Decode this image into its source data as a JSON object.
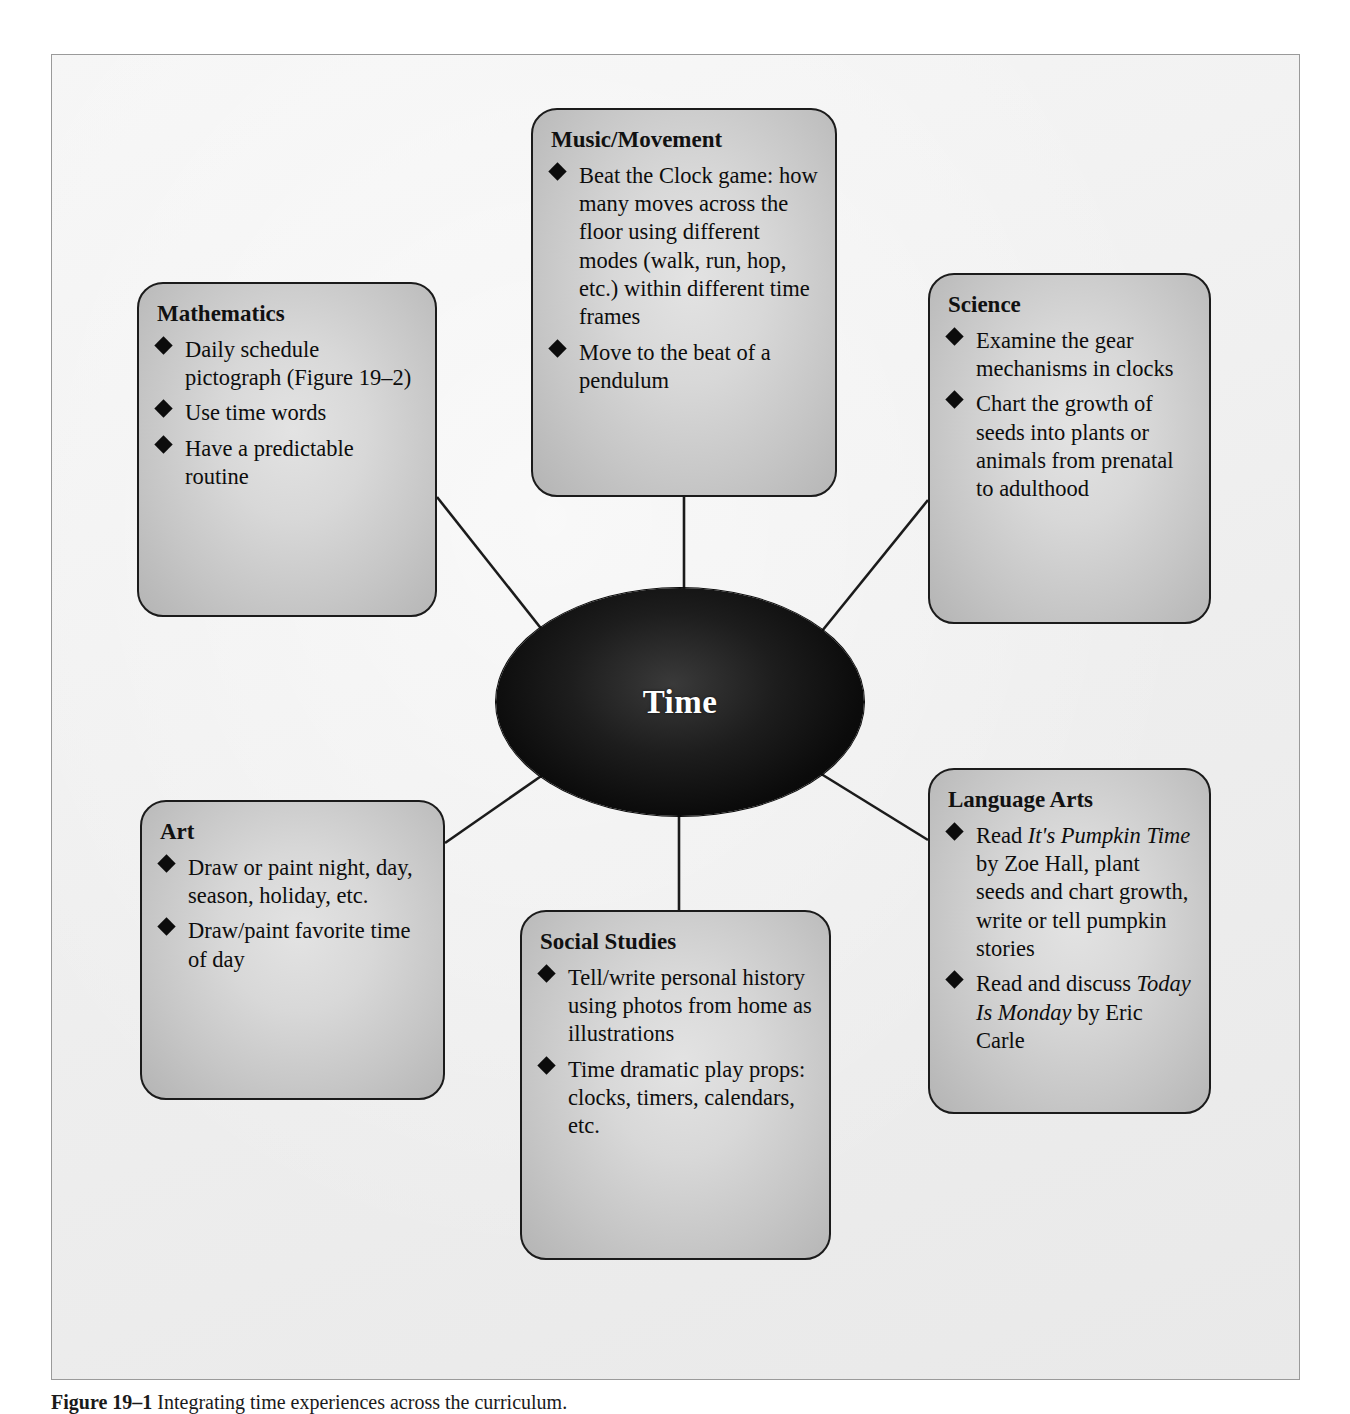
{
  "figure": {
    "center_label": "Time",
    "caption_label": "Figure 19–1",
    "caption_text": "Integrating time experiences across the curriculum."
  },
  "nodes": [
    {
      "id": "mathematics",
      "title": "Mathematics",
      "items": [
        "Daily schedule pictograph (Figure 19–2)",
        "Use time words",
        "Have a predictable routine"
      ]
    },
    {
      "id": "music-movement",
      "title": "Music/Movement",
      "items": [
        "Beat the Clock game: how many moves across the floor using different modes (walk, run, hop, etc.) within different time frames",
        "Move to the beat of a pendulum"
      ]
    },
    {
      "id": "science",
      "title": "Science",
      "items": [
        "Examine the gear mechanisms in clocks",
        "Chart the growth of seeds into plants or animals from prenatal to adulthood"
      ]
    },
    {
      "id": "language-arts",
      "title": "Language Arts",
      "items": [
        "Read It's Pumpkin Time by Zoe Hall, plant seeds and chart growth, write or tell pumpkin stories",
        "Read and discuss Today Is Monday by Eric Carle"
      ],
      "italic_titles": [
        "It's Pumpkin Time",
        "Today Is Monday"
      ]
    },
    {
      "id": "social-studies",
      "title": "Social Studies",
      "items": [
        "Tell/write personal history using photos from home as illustrations",
        "Time dramatic play props: clocks, timers, calendars, etc."
      ]
    },
    {
      "id": "art",
      "title": "Art",
      "items": [
        "Draw or paint night, day, season, holiday, etc.",
        "Draw/paint favorite time of day"
      ]
    }
  ],
  "colors": {
    "page_background": "#ffffff",
    "frame_background": "#f2f2f2",
    "frame_border": "#9a9a9a",
    "node_border": "#1b1b1b",
    "node_fill_light": "#e3e3e3",
    "node_fill_dark": "#b4b4b4",
    "center_fill": "#0b0b0b",
    "center_text": "#ffffff",
    "bullet": "#0c0c0c",
    "connector": "#1b1b1b"
  }
}
